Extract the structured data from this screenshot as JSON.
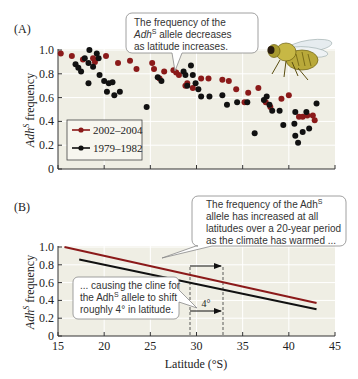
{
  "panel_a": {
    "label": "(A)",
    "callout_lines": [
      "The frequency of the",
      "Adh",
      "S",
      " allele decreases",
      "as latitude increases."
    ],
    "ylabel_main": "Adh",
    "ylabel_sup": "S",
    "ylabel_rest": " frequency",
    "yticks": [
      "1.0",
      "0.8",
      "0.6",
      "0.4",
      "0.2",
      "0"
    ],
    "legend": [
      {
        "label": "2002–2004",
        "color": "#8b1a1a"
      },
      {
        "label": "1979–1982",
        "color": "#111111"
      }
    ],
    "fly_icon": "fruit-fly-illustration"
  },
  "panel_b": {
    "label": "(B)",
    "callout_top": [
      "The frequency of the Adh",
      "S",
      "allele has increased at all",
      "latitudes over a 20-year period",
      "as the climate has warmed ..."
    ],
    "callout_bottom": [
      "... causing the cline for",
      "the Adh",
      "S",
      " allele to shift",
      "roughly 4° in latitude."
    ],
    "shift_label": "4°",
    "ylabel_main": "Adh",
    "ylabel_sup": "S",
    "ylabel_rest": " frequency",
    "yticks": [
      "1.0",
      "0.8",
      "0.6",
      "0.4",
      "0.2",
      "0"
    ],
    "xticks": [
      "15",
      "20",
      "25",
      "30",
      "35",
      "40",
      "45"
    ],
    "xlabel": "Latitude (°S)"
  },
  "chart_data": [
    {
      "type": "scatter",
      "title": "(A)",
      "xlabel": "",
      "ylabel": "AdhS frequency",
      "xlim": [
        15,
        45
      ],
      "ylim": [
        0,
        1.0
      ],
      "annotations": [
        "The frequency of the AdhS allele decreases as latitude increases."
      ],
      "legend_position": "lower-left",
      "series": [
        {
          "name": "2002–2004",
          "color": "#8b1a1a",
          "points": [
            [
              15.3,
              0.97
            ],
            [
              16.5,
              0.95
            ],
            [
              17.7,
              0.92
            ],
            [
              18.8,
              0.93
            ],
            [
              19.0,
              0.9
            ],
            [
              20.2,
              0.95
            ],
            [
              21.5,
              0.89
            ],
            [
              22.8,
              0.91
            ],
            [
              23.5,
              0.84
            ],
            [
              25.2,
              0.89
            ],
            [
              25.4,
              0.84
            ],
            [
              26.0,
              0.76
            ],
            [
              26.5,
              0.82
            ],
            [
              27.5,
              0.83
            ],
            [
              27.8,
              0.81
            ],
            [
              28.1,
              0.79
            ],
            [
              28.8,
              0.7
            ],
            [
              29.0,
              0.72
            ],
            [
              29.6,
              0.68
            ],
            [
              30.5,
              0.76
            ],
            [
              31.3,
              0.76
            ],
            [
              32.8,
              0.75
            ],
            [
              33.5,
              0.74
            ],
            [
              34.3,
              0.67
            ],
            [
              35.2,
              0.56
            ],
            [
              35.6,
              0.64
            ],
            [
              36.7,
              0.68
            ],
            [
              37.5,
              0.56
            ],
            [
              38.0,
              0.52
            ],
            [
              39.2,
              0.59
            ],
            [
              40.0,
              0.62
            ],
            [
              41.1,
              0.44
            ],
            [
              41.5,
              0.44
            ],
            [
              42.0,
              0.45
            ],
            [
              42.6,
              0.45
            ],
            [
              42.8,
              0.41
            ]
          ]
        },
        {
          "name": "1979–1982",
          "color": "#111111",
          "points": [
            [
              16.9,
              0.88
            ],
            [
              17.2,
              0.85
            ],
            [
              17.5,
              0.82
            ],
            [
              17.9,
              0.93
            ],
            [
              18.3,
              0.89
            ],
            [
              18.4,
              1.0
            ],
            [
              18.8,
              0.86
            ],
            [
              19.2,
              0.97
            ],
            [
              19.4,
              0.93
            ],
            [
              18.3,
              0.72
            ],
            [
              19.5,
              0.79
            ],
            [
              20.0,
              0.74
            ],
            [
              20.5,
              0.72
            ],
            [
              20.9,
              0.73
            ],
            [
              20.3,
              0.65
            ],
            [
              21.1,
              0.62
            ],
            [
              21.7,
              0.65
            ],
            [
              24.6,
              0.52
            ],
            [
              25.8,
              0.77
            ],
            [
              26.2,
              0.74
            ],
            [
              28.6,
              0.82
            ],
            [
              28.8,
              0.79
            ],
            [
              29.4,
              0.87
            ],
            [
              29.6,
              0.79
            ],
            [
              29.0,
              0.7
            ],
            [
              29.9,
              0.72
            ],
            [
              30.2,
              0.67
            ],
            [
              30.5,
              0.61
            ],
            [
              31.4,
              0.61
            ],
            [
              32.8,
              0.62
            ],
            [
              33.3,
              0.54
            ],
            [
              34.4,
              0.56
            ],
            [
              35.5,
              0.56
            ],
            [
              36.3,
              0.3
            ],
            [
              37.3,
              0.58
            ],
            [
              37.6,
              0.61
            ],
            [
              37.9,
              0.54
            ],
            [
              38.2,
              0.49
            ],
            [
              39.0,
              0.49
            ],
            [
              39.4,
              0.37
            ],
            [
              40.7,
              0.48
            ],
            [
              40.6,
              0.38
            ],
            [
              41.5,
              0.31
            ],
            [
              40.7,
              0.28
            ],
            [
              41.9,
              0.48
            ],
            [
              42.2,
              0.34
            ],
            [
              41.0,
              0.22
            ],
            [
              43.0,
              0.55
            ]
          ]
        }
      ]
    },
    {
      "type": "line",
      "title": "(B)",
      "xlabel": "Latitude (°S)",
      "ylabel": "AdhS frequency",
      "xlim": [
        15,
        45
      ],
      "ylim": [
        0,
        1.0
      ],
      "x": [
        15,
        20,
        25,
        30,
        35,
        40,
        45
      ],
      "series": [
        {
          "name": "2002–2004",
          "color": "#8b1a1a",
          "points": [
            [
              15.7,
              1.0
            ],
            [
              43.0,
              0.37
            ]
          ]
        },
        {
          "name": "1979–1982",
          "color": "#111111",
          "points": [
            [
              17.3,
              0.86
            ],
            [
              43.0,
              0.3
            ]
          ]
        }
      ],
      "annotations": [
        "The frequency of the AdhS allele has increased at all latitudes over a 20-year period as the climate has warmed ...",
        "... causing the cline for the AdhS allele to shift roughly 4° in latitude.",
        "4°"
      ],
      "shift_markers": {
        "from_lat": 29.3,
        "to_lat": 33.0,
        "level": 0.6
      }
    }
  ]
}
